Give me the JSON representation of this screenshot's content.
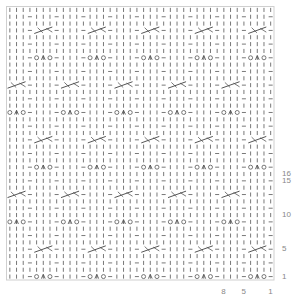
{
  "chart_data": {
    "type": "knitting-chart",
    "title": "",
    "stitch_repeat": 8,
    "row_repeat": 16,
    "total_columns": 40,
    "total_rows": 40,
    "legend_keys": {
      "|": "knit",
      "-": "purl",
      "O": "yarn-over",
      "A": "sk2p-decrease",
      "X": "cable-cross-3"
    },
    "repeat_rows": [
      "|||-OAO-",
      "||||||||",
      "|||-|||-",
      "||||||||",
      "|||-XXX-",
      "||||||||",
      "|||-|||-",
      "||||||||",
      "OAO-|||-",
      "||||||||",
      "|||-|||-",
      "||||||||",
      "XXX-|||-",
      "||||||||",
      "|||-|||-",
      "||||||||"
    ],
    "row_labels": [
      "1",
      "5",
      "10",
      "15",
      "16"
    ],
    "row_label_values": [
      1,
      5,
      10,
      15,
      16
    ],
    "column_labels": [
      "8",
      "5",
      "1"
    ],
    "column_label_values": [
      8,
      5,
      1
    ],
    "colors": {
      "grid": "#cfcfcf",
      "symbol": "#555555",
      "label": "#888888"
    }
  }
}
